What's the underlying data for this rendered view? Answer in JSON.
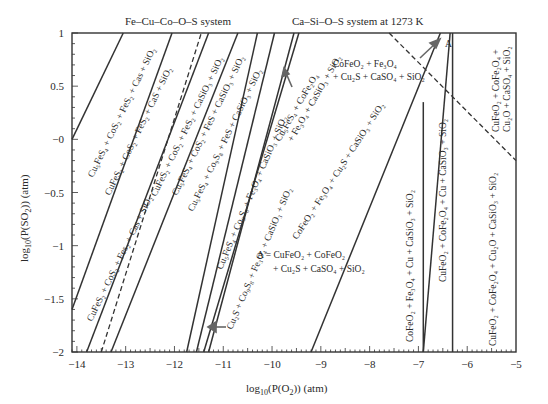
{
  "chart_data": {
    "type": "line",
    "title_left": "Fe–Cu–Co–O–S system",
    "title_right": "Ca–Si–O–S system at 1273 K",
    "xlabel": "log₁₀(P(O₂)) (atm)",
    "ylabel": "log₁₀(P(SO₂)) (atm)",
    "xlim": [
      -14.1,
      -5
    ],
    "ylim": [
      -2,
      1
    ],
    "x_ticks": [
      -14,
      -13,
      -12,
      -11,
      -10,
      -9,
      -8,
      -7,
      -6,
      -5
    ],
    "x_tick_labels": [
      "−14",
      "−13",
      "−12",
      "−11",
      "−10",
      "−9",
      "−8",
      "−7",
      "−6",
      "−5"
    ],
    "y_ticks": [
      1,
      0.5,
      0,
      -0.5,
      -1,
      -1.5,
      -2
    ],
    "y_tick_labels": [
      "1",
      "0.5",
      "−0",
      "−0.5",
      "−1",
      "−1.5",
      "−2"
    ],
    "grid": false,
    "legend": "none",
    "boundaries": [
      {
        "style": "solid",
        "x": [
          -14.1,
          -13.05
        ],
        "y": [
          0,
          1
        ]
      },
      {
        "style": "solid",
        "x": [
          -14.1,
          -12.05
        ],
        "y": [
          -1.6,
          1
        ]
      },
      {
        "style": "solid",
        "x": [
          -13.8,
          -11.3
        ],
        "y": [
          -2,
          1
        ]
      },
      {
        "style": "dashed",
        "x": [
          -13.5,
          -11.45
        ],
        "y": [
          -2,
          1
        ]
      },
      {
        "style": "solid",
        "x": [
          -13.3,
          -10.7
        ],
        "y": [
          -2,
          1
        ]
      },
      {
        "style": "solid",
        "x": [
          -11.75,
          -10.3
        ],
        "y": [
          -2,
          1
        ]
      },
      {
        "style": "solid",
        "x": [
          -11.55,
          -9.95
        ],
        "y": [
          -2,
          1
        ]
      },
      {
        "style": "solid",
        "x": [
          -11.3,
          -9.55
        ],
        "y": [
          -2,
          1
        ]
      },
      {
        "style": "solid",
        "x": [
          -11.4,
          -9.45
        ],
        "y": [
          -2,
          1
        ]
      },
      {
        "style": "solid",
        "x": [
          -9.2,
          -6.55
        ],
        "y": [
          -2,
          1
        ]
      },
      {
        "style": "solid",
        "x": [
          -6.9,
          -6.35
        ],
        "y": [
          -2,
          1
        ]
      },
      {
        "style": "solid",
        "x": [
          -6.9,
          -6.9
        ],
        "y": [
          -2,
          0.35
        ]
      },
      {
        "style": "solid",
        "x": [
          -6.3,
          -6.3
        ],
        "y": [
          -2,
          1
        ]
      },
      {
        "style": "dashed",
        "x": [
          -7.6,
          -5.0
        ],
        "y": [
          1,
          -0.2
        ]
      }
    ],
    "regions": [
      {
        "label": "Cu₅FeS₄ + CoS₂ + FeS₂ + Cas + SiO₂"
      },
      {
        "label": "CuFeS₂ + CoS₂ + FeS₂ + CaS + SiO₂"
      },
      {
        "label": "CuFeS₂ + CoS₂ + Fes₂ + Cas + SiO₂"
      },
      {
        "label": "CuFeS₂ + CoS₂ + FeS₂ + CaSiO₃ + SiO₂"
      },
      {
        "label": "Cu₅FeS₄ + CoS₂ + FeS + CaSiO₃ + SiO₂"
      },
      {
        "label": "Cu₅FeS₄ + Co₉S₈ + FeS + CaSiO₃ + SiO₂"
      },
      {
        "label": "Cu₅FeS₄ + Co₉S₈ + Fe₃O₄ + CaSiO₃ + SiO₂"
      },
      {
        "label": "Cu₂S + Co₉S₈ + Fe₃O₄ + CaSiO₃ + SiO₂"
      },
      {
        "label": "Cu₅FeS₄ + CoFe₂O₄ + Fe₃O₄ + CaSiO₃ + SiO₂"
      },
      {
        "label": "CoFeO₂ + Fe₃O₄ + Cu₂S + CaSiO₃ + SiO₂"
      },
      {
        "label": "CoFeO₂ + Fe₃O₄ + Cu₂S + CaSO₄ + SiO₂"
      },
      {
        "label": "A = CuFeO₂ + CoFeO₂ + Cu₂S + CaSO₄ + SiO₂"
      },
      {
        "label": "CoFeO₂ + Fe₃O₄ + Cu + CaSiO₃ + SiO₂"
      },
      {
        "label": "CuFeO₂ + CoFe₂O₄ + Cu + CaSiO₃ + SiO₂"
      },
      {
        "label": "CuFeO₂ + CoFe₂O₄ + Cu₂O + CaSiO₃ + SiO₂"
      },
      {
        "label": "CuFeO₂ + CoFe₂O₄ + Cu₂O + CaSO₄ + SiO₂"
      }
    ],
    "annotations": [
      "A"
    ]
  },
  "labels": {
    "title_left": "Fe–Cu–Co–O–S system",
    "title_right": "Ca–Si–O–S system at 1273 K",
    "xlabel_pre": "log",
    "xlabel_sub": "10",
    "xlabel_post": "(P(O",
    "xlabel_sub2": "2",
    "xlabel_end": ")) (atm)",
    "ylabel_pre": "log",
    "ylabel_sub": "10",
    "ylabel_post": "(P(SO",
    "ylabel_sub2": "2",
    "ylabel_end": ")) (atm)",
    "annot_A": "A"
  }
}
